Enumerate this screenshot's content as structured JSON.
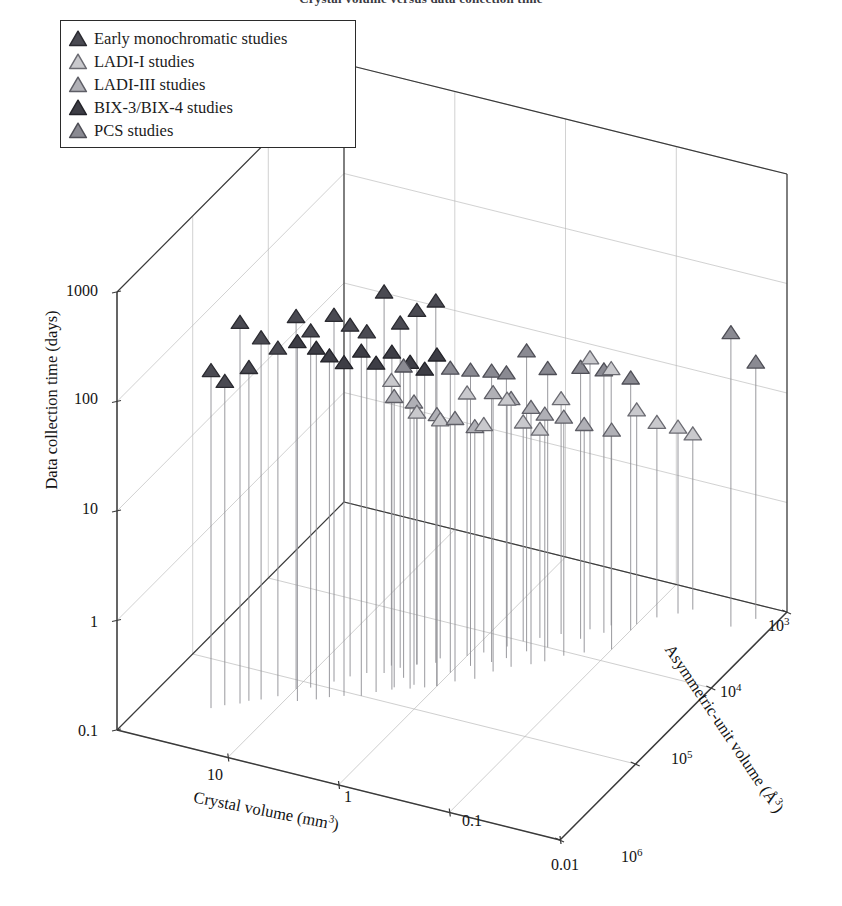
{
  "figure": {
    "title_fragment": "Crystal volume versus data collection time",
    "background": "#ffffff",
    "axis_color": "#3a3a3a",
    "grid_color": "#b9b9b9"
  },
  "legend": {
    "name": "legend-box",
    "items": [
      {
        "label": "Early monochromatic studies",
        "fill": "#4a4a52",
        "stroke": "#2a2a30"
      },
      {
        "label": "LADI-I studies",
        "fill": "#c9c9cd",
        "stroke": "#6b6b72"
      },
      {
        "label": "LADI-III studies",
        "fill": "#b0b0b6",
        "stroke": "#5e5e66"
      },
      {
        "label": "BIX-3/BIX-4 studies",
        "fill": "#3d3d45",
        "stroke": "#232329"
      },
      {
        "label": "PCS studies",
        "fill": "#8a8a92",
        "stroke": "#4e4e56"
      }
    ]
  },
  "chart_data": {
    "type": "scatter",
    "projection": "3d",
    "title": "Crystal volume versus data collection time",
    "xlabel": "Crystal volume (mm",
    "xlabel_sup": "3",
    "xlabel_tail": ")",
    "ylabel": "Asymmetric-unit volume (Å",
    "ylabel_sup": "3",
    "ylabel_tail": ")",
    "zlabel": "Data collection time (days)",
    "grid": true,
    "legend_position": "top-left",
    "x_scale": "log",
    "y_scale": "log",
    "z_scale": "log",
    "x_ticks": [
      "10",
      "1",
      "0.1",
      "0.01"
    ],
    "x_tick_values": [
      10,
      1,
      0.1,
      0.01
    ],
    "x_direction": "decreasing-left-to-right",
    "xlim": [
      100,
      0.01
    ],
    "y_ticks": [
      "10³",
      "10⁴",
      "10⁵",
      "10⁶"
    ],
    "y_tick_values": [
      1000,
      10000,
      100000,
      1000000
    ],
    "y_direction": "increasing-back-to-front",
    "ylim": [
      1000,
      1000000
    ],
    "z_ticks": [
      "1000",
      "100",
      "10",
      "1",
      "0.1"
    ],
    "z_tick_values": [
      1000,
      100,
      10,
      1,
      0.1
    ],
    "zlim": [
      0.1,
      1000
    ],
    "series": [
      {
        "name": "Early monochromatic studies",
        "color": "#4a4a52",
        "points": [
          {
            "x": 30,
            "y": 3000,
            "z": 120
          },
          {
            "x": 20,
            "y": 4000,
            "z": 300
          },
          {
            "x": 15,
            "y": 5000,
            "z": 200
          },
          {
            "x": 12,
            "y": 6000,
            "z": 150
          },
          {
            "x": 10,
            "y": 8000,
            "z": 250
          },
          {
            "x": 8,
            "y": 9000,
            "z": 180
          },
          {
            "x": 6,
            "y": 12000,
            "z": 220
          },
          {
            "x": 5,
            "y": 15000,
            "z": 160
          },
          {
            "x": 4,
            "y": 18000,
            "z": 130
          },
          {
            "x": 3,
            "y": 20000,
            "z": 300
          },
          {
            "x": 25,
            "y": 3500,
            "z": 90
          },
          {
            "x": 18,
            "y": 4500,
            "z": 110
          },
          {
            "x": 2.5,
            "y": 25000,
            "z": 140
          },
          {
            "x": 2,
            "y": 30000,
            "z": 170
          },
          {
            "x": 1.5,
            "y": 35000,
            "z": 200
          }
        ]
      },
      {
        "name": "LADI-I studies",
        "color": "#c9c9cd",
        "points": [
          {
            "x": 2,
            "y": 30000,
            "z": 20
          },
          {
            "x": 1.5,
            "y": 40000,
            "z": 15
          },
          {
            "x": 1,
            "y": 50000,
            "z": 25
          },
          {
            "x": 0.8,
            "y": 60000,
            "z": 12
          },
          {
            "x": 0.6,
            "y": 80000,
            "z": 18
          },
          {
            "x": 0.5,
            "y": 100000,
            "z": 10
          },
          {
            "x": 0.4,
            "y": 120000,
            "z": 8
          },
          {
            "x": 0.3,
            "y": 150000,
            "z": 14
          },
          {
            "x": 0.2,
            "y": 200000,
            "z": 30
          },
          {
            "x": 0.15,
            "y": 250000,
            "z": 22
          },
          {
            "x": 0.1,
            "y": 300000,
            "z": 9
          },
          {
            "x": 0.08,
            "y": 400000,
            "z": 6
          },
          {
            "x": 0.06,
            "y": 500000,
            "z": 5
          },
          {
            "x": 3,
            "y": 25000,
            "z": 40
          },
          {
            "x": 0.05,
            "y": 600000,
            "z": 4
          }
        ]
      },
      {
        "name": "LADI-III studies",
        "color": "#b0b0b6",
        "points": [
          {
            "x": 1,
            "y": 20000,
            "z": 30
          },
          {
            "x": 0.8,
            "y": 25000,
            "z": 25
          },
          {
            "x": 0.6,
            "y": 30000,
            "z": 20
          },
          {
            "x": 0.5,
            "y": 40000,
            "z": 35
          },
          {
            "x": 0.4,
            "y": 50000,
            "z": 28
          },
          {
            "x": 0.3,
            "y": 60000,
            "z": 22
          },
          {
            "x": 0.25,
            "y": 70000,
            "z": 18
          },
          {
            "x": 0.2,
            "y": 90000,
            "z": 15
          },
          {
            "x": 0.15,
            "y": 110000,
            "z": 12
          },
          {
            "x": 0.1,
            "y": 140000,
            "z": 10
          },
          {
            "x": 2,
            "y": 15000,
            "z": 45
          },
          {
            "x": 1.5,
            "y": 18000,
            "z": 38
          }
        ]
      },
      {
        "name": "BIX-3/BIX-4 studies",
        "color": "#3d3d45",
        "points": [
          {
            "x": 5,
            "y": 8000,
            "z": 130
          },
          {
            "x": 4,
            "y": 9000,
            "z": 110
          },
          {
            "x": 3,
            "y": 10000,
            "z": 140
          },
          {
            "x": 2.5,
            "y": 12000,
            "z": 100
          },
          {
            "x": 2,
            "y": 14000,
            "z": 120
          },
          {
            "x": 1.5,
            "y": 16000,
            "z": 95
          },
          {
            "x": 1.2,
            "y": 18000,
            "z": 80
          },
          {
            "x": 1,
            "y": 20000,
            "z": 105
          },
          {
            "x": 6,
            "y": 7000,
            "z": 160
          },
          {
            "x": 8,
            "y": 6000,
            "z": 190
          }
        ]
      },
      {
        "name": "PCS studies",
        "color": "#8a8a92",
        "points": [
          {
            "x": 1,
            "y": 30000,
            "z": 60
          },
          {
            "x": 0.8,
            "y": 40000,
            "z": 50
          },
          {
            "x": 0.6,
            "y": 50000,
            "z": 45
          },
          {
            "x": 0.5,
            "y": 60000,
            "z": 40
          },
          {
            "x": 0.4,
            "y": 80000,
            "z": 55
          },
          {
            "x": 0.3,
            "y": 100000,
            "z": 35
          },
          {
            "x": 0.2,
            "y": 150000,
            "z": 30
          },
          {
            "x": 0.15,
            "y": 200000,
            "z": 25
          },
          {
            "x": 0.1,
            "y": 250000,
            "z": 20
          },
          {
            "x": 2,
            "y": 20000,
            "z": 70
          },
          {
            "x": 0.02,
            "y": 500000,
            "z": 48
          },
          {
            "x": 0.015,
            "y": 700000,
            "z": 22
          }
        ]
      }
    ]
  },
  "axes": {
    "z_ticks": [
      {
        "label": "1000",
        "top": 282
      },
      {
        "label": "100",
        "top": 390
      },
      {
        "label": "10",
        "top": 500
      },
      {
        "label": "1",
        "top": 613
      },
      {
        "label": "0.1",
        "top": 722
      }
    ],
    "x_ticks": [
      {
        "label": "10",
        "left": 207,
        "top": 766
      },
      {
        "label": "1",
        "left": 344,
        "top": 788
      },
      {
        "label": "0.1",
        "left": 462,
        "top": 812
      },
      {
        "label": "0.01",
        "left": 551,
        "top": 856
      }
    ],
    "y_ticks": [
      {
        "label": "10",
        "sup": "3",
        "left": 768,
        "top": 615
      },
      {
        "label": "10",
        "sup": "4",
        "left": 720,
        "top": 681
      },
      {
        "label": "10",
        "sup": "5",
        "left": 671,
        "top": 748
      },
      {
        "label": "10",
        "sup": "6",
        "left": 621,
        "top": 846
      }
    ]
  }
}
